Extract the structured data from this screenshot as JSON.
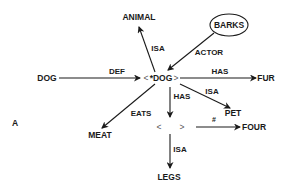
{
  "figure_label": "A",
  "center_node": {
    "open": "<",
    "label": "*DOG",
    "close": ">"
  },
  "blank_node": {
    "open": "<",
    "close": ">"
  },
  "nodes": {
    "animal": "ANIMAL",
    "barks": "BARKS",
    "dog": "DOG",
    "fur": "FUR",
    "pet": "PET",
    "meat": "MEAT",
    "four": "FOUR",
    "legs": "LEGS"
  },
  "edges": {
    "isa_animal": "ISA",
    "actor": "ACTOR",
    "def": "DEF",
    "has_fur": "HAS",
    "isa_pet": "ISA",
    "has_blank": "HAS",
    "eats": "EATS",
    "count": "#",
    "isa_legs": "ISA"
  },
  "colors": {
    "ink": "#1a1a1a",
    "background": "#ffffff"
  }
}
